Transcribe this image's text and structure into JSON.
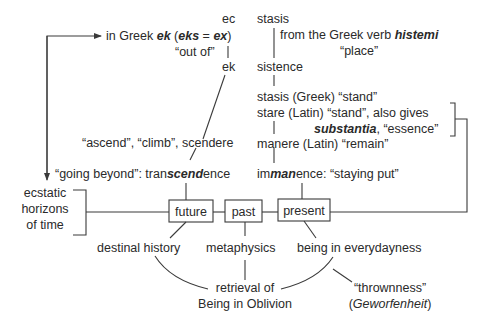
{
  "diagram": {
    "left_column": {
      "ec": "ec",
      "greek_prefix": "in Greek ",
      "ek": "ek",
      "paren_open": " (",
      "eks": "eks",
      "equals": " = ",
      "ex": "ex",
      "paren_close": ")",
      "out_of": "“out of”",
      "ek_plain": "ek",
      "ascend": "“ascend”, “climb”, scendere",
      "going_beyond_prefix": "“going beyond”: tran",
      "going_beyond_emph": "scend",
      "going_beyond_suffix": "ence"
    },
    "right_column": {
      "stasis": "stasis",
      "greek_verb_prefix": "from the Greek verb ",
      "histemi": "histemi",
      "place": "“place”",
      "sistence": "sistence",
      "stasis_greek": "stasis (Greek) “stand”",
      "stare_latin": "stare (Latin) “stand”, also gives",
      "substantia": "substantia",
      "essence": ", “essence”",
      "manere": "manere (Latin) “remain”",
      "immanence_prefix": "im",
      "immanence_emph": "man",
      "immanence_suffix": "ence: “staying put”"
    },
    "horizons": {
      "line1": "ecstatic",
      "line2": "horizons",
      "line3": "of time"
    },
    "boxes": {
      "future": "future",
      "past": "past",
      "present": "present"
    },
    "bottom": {
      "destinal_history": "destinal history",
      "metaphysics": "metaphysics",
      "everydayness": "being in everydayness",
      "retrieval_line1": "retrieval of",
      "retrieval_line2": "Being in Oblivion",
      "thrownness": "“thrownness”",
      "geworfenheit_open": "(",
      "geworfenheit": "Geworfenheit",
      "geworfenheit_close": ")"
    }
  }
}
